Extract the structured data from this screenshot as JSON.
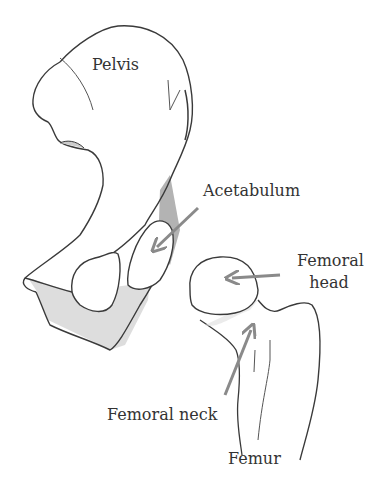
{
  "diagram": {
    "colors": {
      "outline": "#3a3a3a",
      "arrow": "#8a8a8a",
      "shade": "#bdbdbd",
      "text": "#333333",
      "background": "#ffffff"
    },
    "labels": {
      "pelvis": "Pelvis",
      "acetabulum": "Acetabulum",
      "femoral_head_line1": "Femoral",
      "femoral_head_line2": "head",
      "femoral_neck": "Femoral neck",
      "femur": "Femur"
    },
    "structures": [
      {
        "name": "pelvis",
        "label": "Pelvis"
      },
      {
        "name": "acetabulum",
        "label": "Acetabulum",
        "arrow": true
      },
      {
        "name": "femoral-head",
        "label": "Femoral head",
        "arrow": true
      },
      {
        "name": "femoral-neck",
        "label": "Femoral neck",
        "arrow": true
      },
      {
        "name": "femur",
        "label": "Femur"
      }
    ]
  }
}
